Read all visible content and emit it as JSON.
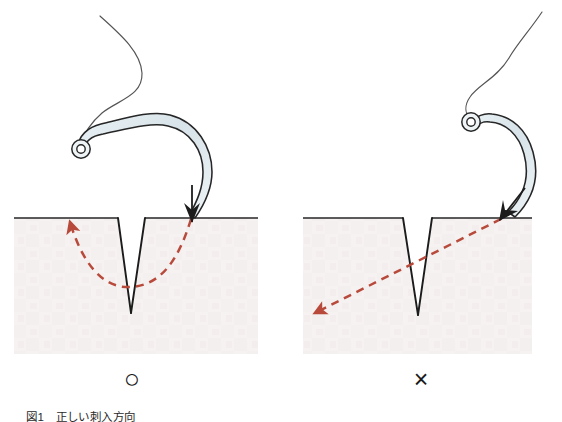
{
  "figure": {
    "caption": "図1　正しい刺入方向",
    "panels": [
      {
        "id": "correct",
        "verdict_mark": "○",
        "verdict_meaning": "correct",
        "description": "Needle enters perpendicular to the skin surface and follows a curved arc beneath the wound, exiting on the opposite side.",
        "needle_entry_angle_deg": 90,
        "path_shape": "arc"
      },
      {
        "id": "incorrect",
        "verdict_mark": "×",
        "verdict_meaning": "incorrect",
        "description": "Needle enters obliquely and travels in a straight diagonal line, passing too deep and away from the wound.",
        "needle_entry_angle_deg": 45,
        "path_shape": "straight"
      }
    ],
    "colors": {
      "tissue_fill": "#f5f1f0",
      "outline": "#1a1a1a",
      "needle_fill": "#dde7ec",
      "needle_outline": "#262626",
      "path_arrow": "#b84a3c",
      "thread": "#4a4a4a",
      "background": "#ffffff"
    },
    "labels": {
      "tissue": "tissue",
      "wound": "wound",
      "needle": "curved suture needle",
      "thread": "suture thread",
      "path": "needle path"
    }
  }
}
